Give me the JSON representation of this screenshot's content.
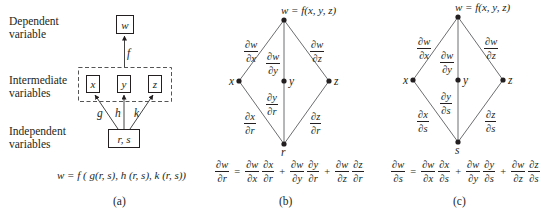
{
  "panel_a": {
    "labels": {
      "dependent": [
        "Dependent",
        "variable"
      ],
      "intermediate": [
        "Intermediate",
        "variables"
      ],
      "independent": [
        "Independent",
        "variables"
      ]
    },
    "nodes": {
      "w": "w",
      "x": "x",
      "y": "y",
      "z": "z",
      "rs": "r, s"
    },
    "edges": {
      "f": "f",
      "g": "g",
      "h": "h",
      "k": "k"
    },
    "formula": "w = f ( g(r, s), h (r, s), k (r, s))",
    "caption": "(a)"
  },
  "panel_b": {
    "top_label": "w = f(x, y, z)",
    "nodes": {
      "x": "x",
      "y": "y",
      "z": "z",
      "bottom": "r"
    },
    "edges": {
      "wx": {
        "num": "∂w",
        "den": "∂x"
      },
      "wy": {
        "num": "∂w",
        "den": "∂y"
      },
      "wz": {
        "num": "∂w",
        "den": "∂z"
      },
      "x_var": {
        "num": "∂x",
        "den": "∂r"
      },
      "y_var": {
        "num": "∂y",
        "den": "∂r"
      },
      "z_var": {
        "num": "∂z",
        "den": "∂r"
      }
    },
    "equation": {
      "lhs": {
        "num": "∂w",
        "den": "∂r"
      },
      "terms": [
        [
          {
            "num": "∂w",
            "den": "∂x"
          },
          {
            "num": "∂x",
            "den": "∂r"
          }
        ],
        [
          {
            "num": "∂w",
            "den": "∂y"
          },
          {
            "num": "∂y",
            "den": "∂r"
          }
        ],
        [
          {
            "num": "∂w",
            "den": "∂z"
          },
          {
            "num": "∂z",
            "den": "∂r"
          }
        ]
      ],
      "equals": "=",
      "plus": "+"
    },
    "caption": "(b)"
  },
  "panel_c": {
    "top_label": "w = f(x, y, z)",
    "nodes": {
      "x": "x",
      "y": "y",
      "z": "z",
      "bottom": "s"
    },
    "edges": {
      "wx": {
        "num": "∂w",
        "den": "∂x"
      },
      "wy": {
        "num": "∂w",
        "den": "∂y"
      },
      "wz": {
        "num": "∂w",
        "den": "∂z"
      },
      "x_var": {
        "num": "∂x",
        "den": "∂s"
      },
      "y_var": {
        "num": "∂y",
        "den": "∂s"
      },
      "z_var": {
        "num": "∂z",
        "den": "∂s"
      }
    },
    "equation": {
      "lhs": {
        "num": "∂w",
        "den": "∂s"
      },
      "terms": [
        [
          {
            "num": "∂w",
            "den": "∂x"
          },
          {
            "num": "∂x",
            "den": "∂s"
          }
        ],
        [
          {
            "num": "∂w",
            "den": "∂y"
          },
          {
            "num": "∂y",
            "den": "∂s"
          }
        ],
        [
          {
            "num": "∂w",
            "den": "∂z"
          },
          {
            "num": "∂z",
            "den": "∂s"
          }
        ]
      ],
      "equals": "=",
      "plus": "+"
    },
    "caption": "(c)"
  },
  "colors": {
    "ink": "#231f20",
    "line": "#6d6e71"
  }
}
